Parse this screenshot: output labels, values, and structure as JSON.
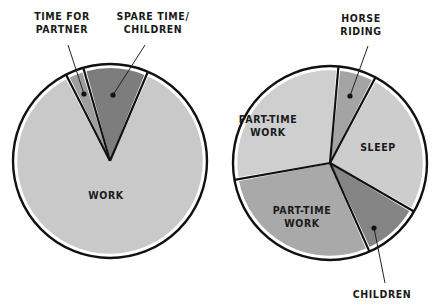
{
  "chart_data": [
    {
      "type": "pie",
      "name": "left-pie",
      "title": "",
      "center": [
        110,
        161
      ],
      "radius": 97,
      "start_angle_deg": 23,
      "slices": [
        {
          "label": "WORK",
          "degrees": 310,
          "share_pct": 86.1,
          "color": "#c9c9c9",
          "label_lines": [
            "WORK"
          ],
          "label_pos": [
            106,
            199
          ],
          "callout": null
        },
        {
          "label": "TIME FOR PARTNER",
          "degrees": 11,
          "share_pct": 3.1,
          "color": "#9e9e9e",
          "label_lines": [
            "TIME FOR",
            "PARTNER"
          ],
          "label_pos": [
            62,
            20
          ],
          "callout": {
            "from": [
              68,
              45
            ],
            "to": [
              84,
              94
            ]
          }
        },
        {
          "label": "SPARE TIME/ CHILDREN",
          "degrees": 39,
          "share_pct": 10.8,
          "color": "#7d7d7d",
          "label_lines": [
            "SPARE TIME/",
            "CHILDREN"
          ],
          "label_pos": [
            153,
            20
          ],
          "callout": {
            "from": [
              145,
              45
            ],
            "to": [
              113,
              95
            ]
          }
        }
      ]
    },
    {
      "type": "pie",
      "name": "right-pie",
      "title": "",
      "center": [
        330,
        163
      ],
      "radius": 97,
      "start_angle_deg": 5,
      "slices": [
        {
          "label": "HORSE RIDING",
          "degrees": 23,
          "share_pct": 6.4,
          "color": "#a4a4a4",
          "label_lines": [
            "HORSE",
            "RIDING"
          ],
          "label_pos": [
            361,
            22
          ],
          "callout": {
            "from": [
              368,
              46
            ],
            "to": [
              350,
              96
            ]
          }
        },
        {
          "label": "SLEEP",
          "degrees": 92,
          "share_pct": 25.6,
          "color": "#cdcdcd",
          "label_lines": [
            "SLEEP"
          ],
          "label_pos": [
            378,
            151
          ],
          "callout": null
        },
        {
          "label": "CHILDREN",
          "degrees": 36,
          "share_pct": 10.0,
          "color": "#858585",
          "label_lines": [
            "CHILDREN"
          ],
          "label_pos": [
            382,
            298
          ],
          "callout": {
            "from": [
              385,
              283
            ],
            "to": [
              374,
              228
            ]
          }
        },
        {
          "label": "PART-TIME WORK",
          "degrees": 104,
          "share_pct": 28.9,
          "color": "#a9a9a9",
          "label_lines": [
            "PART-TIME",
            "WORK"
          ],
          "label_pos": [
            302,
            214
          ],
          "callout": null
        },
        {
          "label": "PART-TIME WORK",
          "degrees": 105,
          "share_pct": 29.1,
          "color": "#cfcfcf",
          "label_lines": [
            "PART-TIME",
            "WORK"
          ],
          "label_pos": [
            268,
            123
          ],
          "callout": null
        }
      ]
    }
  ]
}
